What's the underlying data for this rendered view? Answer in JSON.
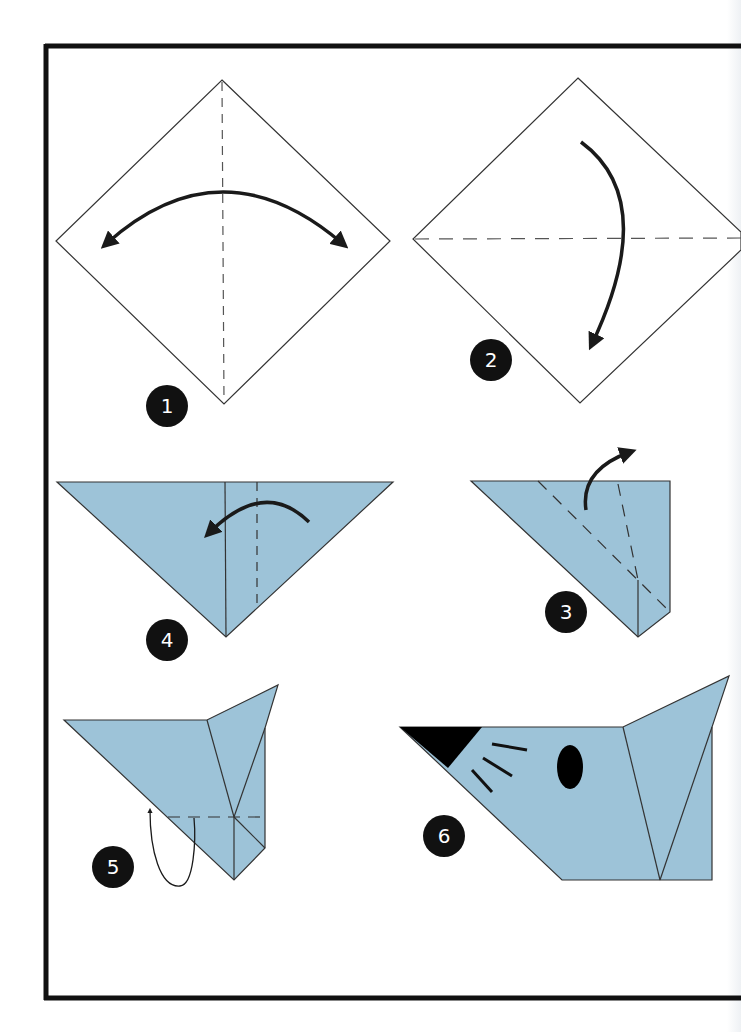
{
  "diagram": {
    "paper_color": "#9dc3d8",
    "line_color": "#222222",
    "frame_color": "#111111",
    "steps": [
      {
        "number": "1",
        "label": "1",
        "instruction_icon": "fold-and-unfold-arrow",
        "crease": "vertical-valley-fold"
      },
      {
        "number": "2",
        "label": "2",
        "instruction_icon": "fold-down-arrow",
        "crease": "horizontal-valley-fold"
      },
      {
        "number": "3",
        "label": "3",
        "instruction_icon": "fold-up-arrow",
        "crease": "diagonal-valley-folds"
      },
      {
        "number": "4",
        "label": "4",
        "instruction_icon": "fold-left-arrow",
        "crease": "vertical-valley-fold"
      },
      {
        "number": "5",
        "label": "5",
        "instruction_icon": "fold-behind-arrow",
        "crease": "horizontal-mountain-fold"
      },
      {
        "number": "6",
        "label": "6",
        "instruction_icon": "none",
        "crease": "finished-mouse-head"
      }
    ]
  }
}
